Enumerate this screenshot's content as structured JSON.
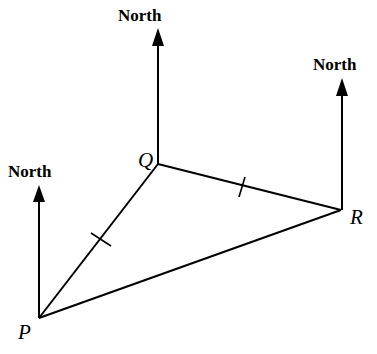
{
  "diagram": {
    "north_label": "North",
    "points": {
      "P": {
        "label": "P",
        "x": 39,
        "y": 318
      },
      "Q": {
        "label": "Q",
        "x": 158,
        "y": 164
      },
      "R": {
        "label": "R",
        "x": 341,
        "y": 210
      }
    },
    "north_arrows": [
      {
        "at": "P",
        "top_y": 185
      },
      {
        "at": "Q",
        "top_y": 28
      },
      {
        "at": "R",
        "top_y": 78
      }
    ],
    "equal_sides": [
      "PQ",
      "QR"
    ],
    "colors": {
      "stroke": "#000000",
      "background": "#ffffff"
    }
  }
}
